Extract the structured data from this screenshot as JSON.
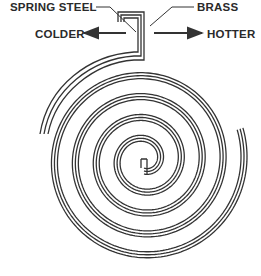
{
  "diagram": {
    "labels": {
      "spring_steel": "SPRING STEEL",
      "brass": "BRASS",
      "colder": "COLDER",
      "hotter": "HOTTER"
    },
    "colors": {
      "line": "#333333",
      "background": "#ffffff"
    },
    "spiral": {
      "center": [
        144,
        160
      ],
      "inner_radius": 11,
      "outer_radius": 101,
      "turns": 4.3,
      "strip_line_offsets": [
        -3,
        0,
        3
      ]
    }
  }
}
